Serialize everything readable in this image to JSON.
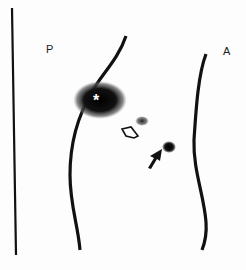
{
  "figure": {
    "type": "lateral scintigraphy image",
    "labels": {
      "posterior": "P",
      "anterior": "A",
      "asterisk": "*"
    },
    "annotations": [
      {
        "kind": "asterisk",
        "description": "intense uptake region on posterior contour"
      },
      {
        "kind": "open-arrow",
        "description": "points to small faint focus"
      },
      {
        "kind": "solid-arrow",
        "description": "points to discrete dark focus"
      }
    ],
    "colors": {
      "ink": "#111111",
      "background": "#fdfdfd"
    }
  }
}
